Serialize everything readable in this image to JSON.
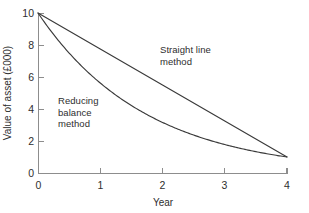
{
  "figure": {
    "background_color": "#ffffff",
    "line_color": "#3a3a3a",
    "axis_color": "#8d8d8d",
    "text_color": "#2e2e2e"
  },
  "chart_data": {
    "type": "line",
    "title": "",
    "subtitle": "",
    "xlabel": "Year",
    "ylabel": "Value of asset (£000)",
    "xlim": [
      0,
      4
    ],
    "ylim": [
      0,
      10
    ],
    "xticks": [
      0,
      1,
      2,
      3,
      4
    ],
    "xtick_labels": [
      "0",
      "1",
      "2",
      "3",
      "4"
    ],
    "yticks": [
      0,
      2,
      4,
      6,
      8,
      10
    ],
    "ytick_labels": [
      "0",
      "2",
      "4",
      "6",
      "8",
      "10"
    ],
    "grid": false,
    "legend": "none",
    "x": [
      0,
      1,
      2,
      3,
      4
    ],
    "series": [
      {
        "name": "Straight line method",
        "values": [
          10,
          7.75,
          5.5,
          3.25,
          1
        ],
        "annotation": "Straight line\nmethod",
        "annotation_x": 2.0,
        "annotation_y": 6.6
      },
      {
        "name": "Reducing balance method",
        "values": [
          10,
          5.62,
          3.16,
          1.78,
          1
        ],
        "annotation": "Reducing\nbalance\nmethod",
        "annotation_x": 0.45,
        "annotation_y": 4.5
      }
    ],
    "annotations": [
      {
        "text": "Straight line\nmethod",
        "x": 2.0,
        "y": 6.6
      },
      {
        "text": "Reducing\nbalance\nmethod",
        "x": 0.45,
        "y": 4.5
      }
    ]
  },
  "axes_geometry": {
    "x0_px": 38,
    "x1_px": 287,
    "y0_px": 173,
    "y1_px": 13
  }
}
